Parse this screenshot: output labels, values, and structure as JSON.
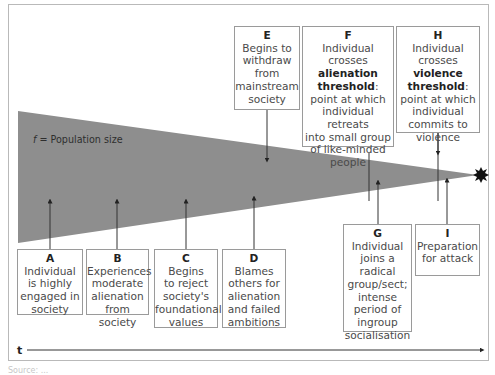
{
  "diagram": {
    "title": "",
    "population_label": {
      "variable": "f",
      "text": " = Population size"
    },
    "time_axis_label": "t",
    "colors": {
      "wedge": "#8e8e8e",
      "box_border": "#9a9a9a",
      "frame_border": "#b9b9b9",
      "arrow": "#222222",
      "attack_burst": "#111111"
    },
    "stages": [
      {
        "id": "A",
        "letter": "A",
        "lines": [
          "Individual",
          "is highly",
          "engaged in",
          "society"
        ]
      },
      {
        "id": "B",
        "letter": "B",
        "lines": [
          "Experiences",
          "moderate",
          "alienation",
          "from society"
        ]
      },
      {
        "id": "C",
        "letter": "C",
        "lines": [
          "Begins",
          "to reject",
          "society's",
          "foundational",
          "values"
        ]
      },
      {
        "id": "D",
        "letter": "D",
        "lines": [
          "Blames",
          "others for",
          "alienation",
          "and failed",
          "ambitions"
        ]
      },
      {
        "id": "E",
        "letter": "E",
        "lines": [
          "Begins to",
          "withdraw",
          "from",
          "mainstream",
          "society"
        ]
      },
      {
        "id": "F",
        "letter": "F",
        "line1": "Individual crosses",
        "bold": "alienation threshold",
        "bold_line1": "alienation",
        "bold_line2": "threshold",
        "after_bold": ":",
        "rest": [
          "point at which",
          "individual retreats",
          "into small group",
          "of like-minded",
          "people"
        ]
      },
      {
        "id": "G",
        "letter": "G",
        "lines": [
          "Individual",
          "joins a radical",
          "group/sect;",
          "intense",
          "period of",
          "ingroup",
          "socialisation"
        ]
      },
      {
        "id": "H",
        "letter": "H",
        "line1": "Individual",
        "line2_pre": "crosses ",
        "bold_line1": "violence",
        "bold_line2": "threshold",
        "after_bold": ":",
        "rest": [
          "point at which",
          "individual",
          "commits to",
          "violence"
        ]
      },
      {
        "id": "I",
        "letter": "I",
        "lines": [
          "Preparation",
          "for attack"
        ]
      }
    ],
    "caption": "Source: ..."
  }
}
